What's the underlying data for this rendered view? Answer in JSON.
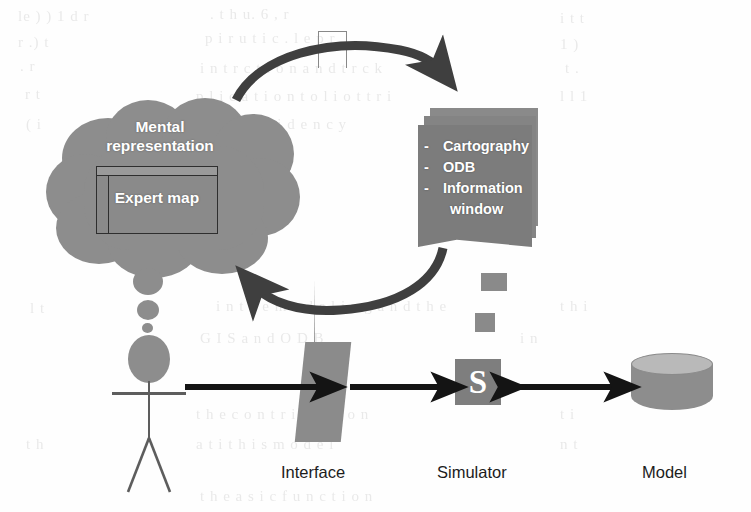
{
  "figure": {
    "type": "conceptual-diagram",
    "background_color": "#ffffff",
    "shape_fill_color": "#8a8a8a",
    "arrow_color": "#1a1a1a",
    "label_text_color": "#1c1c1c",
    "shape_text_color": "#ffffff"
  },
  "cloud": {
    "name": "mental-representation-cloud",
    "label": "Mental\nrepresentation",
    "label_line_1": "Mental",
    "label_line_2": "representation",
    "inner_window": {
      "name": "expert-map-window",
      "label": "Expert map"
    }
  },
  "actor": {
    "name": "user-stick-figure",
    "label": ""
  },
  "cards": {
    "name": "interface-content-cards",
    "count": 3,
    "items": [
      {
        "bullet": "-",
        "label": "Cartography"
      },
      {
        "bullet": "-",
        "label": "ODB"
      },
      {
        "bullet": "-",
        "label": "Information"
      },
      {
        "bullet": "",
        "label": "window"
      }
    ]
  },
  "cycle": {
    "name": "feedback-loop",
    "top_arrow_direction": "right",
    "bottom_arrow_direction": "left"
  },
  "simulator": {
    "name": "simulator-box",
    "letter": "S"
  },
  "model": {
    "name": "model-database-cylinder"
  },
  "captions": {
    "interface": "Interface",
    "simulator": "Simulator",
    "model": "Model"
  },
  "flow_arrows": [
    {
      "name": "user-to-interface-arrow",
      "direction": "right"
    },
    {
      "name": "interface-to-simulator-arrow",
      "direction": "right"
    },
    {
      "name": "simulator-model-arrow",
      "direction": "both"
    }
  ],
  "background_bleed_text": [
    {
      "x": 18,
      "y": 8,
      "text": "le ) ) 1 d r"
    },
    {
      "x": 210,
      "y": 6,
      "text": ". t h u. 6 , r"
    },
    {
      "x": 560,
      "y": 10,
      "text": "i t t"
    },
    {
      "x": 18,
      "y": 34,
      "text": "r .) t"
    },
    {
      "x": 205,
      "y": 30,
      "text": "p i r u t i c . l e p r"
    },
    {
      "x": 560,
      "y": 36,
      "text": "1 )"
    },
    {
      "x": 20,
      "y": 58,
      "text": ". r"
    },
    {
      "x": 200,
      "y": 60,
      "text": "i n t r c t i o n a n d t r c k"
    },
    {
      "x": 565,
      "y": 60,
      "text": "t ."
    },
    {
      "x": 25,
      "y": 86,
      "text": "r t"
    },
    {
      "x": 196,
      "y": 88,
      "text": "p l i c a t i o n t o l i o t t r i"
    },
    {
      "x": 560,
      "y": 88,
      "text": "l l 1"
    },
    {
      "x": 26,
      "y": 116,
      "text": "( i"
    },
    {
      "x": 200,
      "y": 116,
      "text": "d r . t i n r i d e n c y"
    },
    {
      "x": 30,
      "y": 300,
      "text": "l t"
    },
    {
      "x": 216,
      "y": 298,
      "text": "i n t h e m o d e l i n g a n d t h e"
    },
    {
      "x": 560,
      "y": 298,
      "text": "t h i"
    },
    {
      "x": 200,
      "y": 330,
      "text": "G I S a n d O D B"
    },
    {
      "x": 520,
      "y": 330,
      "text": "i n"
    },
    {
      "x": 196,
      "y": 406,
      "text": "t h e c o n t r i b u t i o n"
    },
    {
      "x": 560,
      "y": 406,
      "text": "t i"
    },
    {
      "x": 26,
      "y": 436,
      "text": "t h"
    },
    {
      "x": 196,
      "y": 436,
      "text": "a t i t h i s m o d e l"
    },
    {
      "x": 560,
      "y": 436,
      "text": "n t"
    },
    {
      "x": 200,
      "y": 488,
      "text": "t h e a s i c f u n c t i o n"
    }
  ]
}
